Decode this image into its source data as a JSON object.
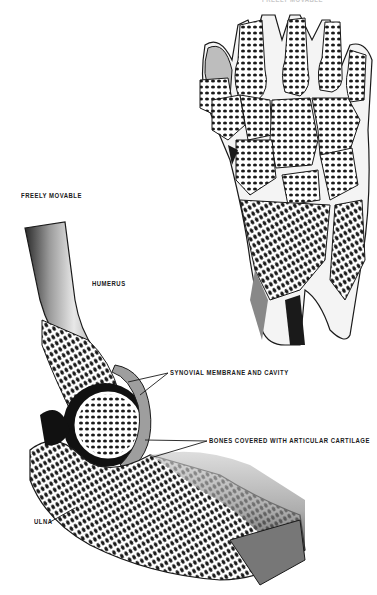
{
  "figure": {
    "top_label_partial": "FREELY MOVABLE",
    "elbow_section_title": "FREELY MOVABLE",
    "labels": {
      "humerus": "HUMERUS",
      "synovial": "SYNOVIAL MEMBRANE AND CAVITY",
      "cartilage": "BONES COVERED WITH ARTICULAR CARTILAGE",
      "ulna": "ULNA"
    },
    "illustrations": [
      "wrist-joint-cross-section",
      "elbow-joint-cross-section"
    ]
  }
}
